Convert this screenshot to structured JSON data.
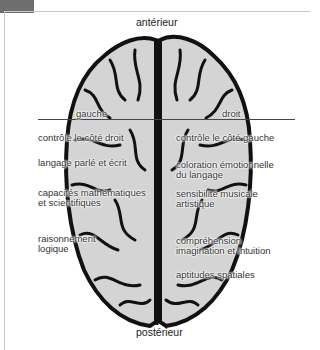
{
  "diagram": {
    "orientation": {
      "top": "antérieur",
      "bottom": "postérieur"
    },
    "hemispheres": {
      "left": {
        "title": "gauche",
        "functions": [
          "contrôle le côté droit",
          "langage parlé et écrit",
          "capacités mathématiques\net scientifiques",
          "raisonnement\nlogique"
        ]
      },
      "right": {
        "title": "droit",
        "functions": [
          "contrôle le côté gauche",
          "coloration émotionnelle\ndu langage",
          "sensibilité musicale\nartistique",
          "compréhension\nimagination et intuition",
          "aptitudes spatiales"
        ]
      }
    },
    "colors": {
      "brain_fill": "#d4d4d4",
      "brain_outline": "#111111",
      "frame": "#c8c8c8",
      "tab": "#6e6e6e"
    }
  }
}
